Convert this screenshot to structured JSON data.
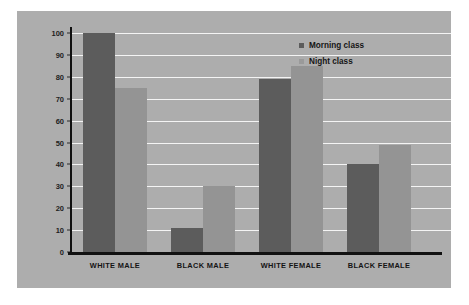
{
  "chart_data": {
    "type": "bar",
    "title": "",
    "xlabel": "",
    "ylabel": "FREQUENCY",
    "categories": [
      "WHITE MALE",
      "BLACK MALE",
      "WHITE FEMALE",
      "BLACK FEMALE"
    ],
    "series": [
      {
        "name": "Morning class",
        "color": "#5c5c5c",
        "values": [
          100,
          11,
          79,
          40
        ]
      },
      {
        "name": "Night class",
        "color": "#949494",
        "values": [
          75,
          30,
          85,
          49
        ]
      }
    ],
    "ylim": [
      0,
      100
    ],
    "ytick_labels": [
      "0",
      "10",
      "20",
      "30",
      "40",
      "50",
      "60",
      "70",
      "80",
      "90",
      "100"
    ],
    "ytick_values": [
      0,
      10,
      20,
      30,
      40,
      50,
      60,
      70,
      80,
      90,
      100
    ],
    "grid": true,
    "grid_axis": "y",
    "grid_color": "#f4f4f4",
    "legend_position": "top-right",
    "panel_background": "#adadad",
    "figure_background": "#ffffff",
    "axis_color": "#111111"
  }
}
